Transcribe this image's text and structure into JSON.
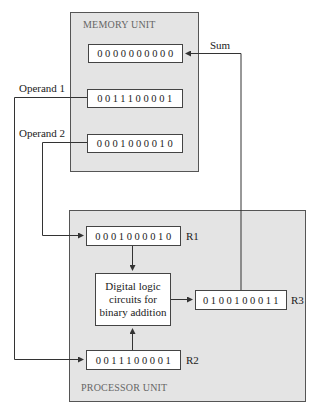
{
  "memory_unit": {
    "title": "MEMORY UNIT",
    "words": [
      {
        "value": "0000000000",
        "role": "sum destination"
      },
      {
        "value": "0011100001",
        "role": "operand 1"
      },
      {
        "value": "0001000010",
        "role": "operand 2"
      }
    ]
  },
  "processor_unit": {
    "title": "PROCESSOR UNIT",
    "registers": {
      "r1": {
        "name": "R1",
        "value": "0001000010"
      },
      "r2": {
        "name": "R2",
        "value": "0011100001"
      },
      "r3": {
        "name": "R3",
        "value": "0100100011"
      }
    },
    "logic": {
      "line1": "Digital logic",
      "line2": "circuits for",
      "line3": "binary addition"
    }
  },
  "connections": {
    "sum_label": "Sum",
    "operand1_label": "Operand 1",
    "operand2_label": "Operand 2"
  },
  "colors": {
    "unit_fill": "#e4e4e4",
    "register_fill": "#ffffff",
    "line": "#333333"
  }
}
